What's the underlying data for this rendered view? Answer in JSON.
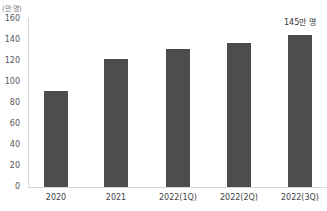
{
  "chart_data": {
    "type": "bar",
    "title": "",
    "unit_label": "(만 명)",
    "xlabel": "",
    "ylabel": "(만 명)",
    "ylim": [
      0,
      160
    ],
    "yticks": [
      0,
      20,
      40,
      60,
      80,
      100,
      120,
      140,
      160
    ],
    "categories": [
      "2020",
      "2021",
      "2022(1Q)",
      "2022(2Q)",
      "2022(3Q)"
    ],
    "values": [
      91,
      122,
      131,
      137,
      145
    ],
    "annotations": [
      {
        "category": "2022(3Q)",
        "text": "145만 명"
      }
    ],
    "grid": false,
    "legend": null,
    "bar_color": "#4d4d4d"
  },
  "labels": {
    "unit": "(만 명)",
    "last_value": "145만 명",
    "yticks": [
      "0",
      "20",
      "40",
      "60",
      "80",
      "100",
      "120",
      "140",
      "160"
    ],
    "categories": [
      "2020",
      "2021",
      "2022(1Q)",
      "2022(2Q)",
      "2022(3Q)"
    ]
  }
}
